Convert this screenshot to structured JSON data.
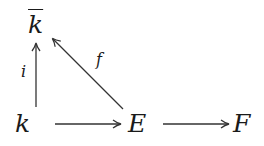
{
  "diagram": {
    "type": "commutative-diagram",
    "nodes": {
      "kbar": {
        "text": "k",
        "decoration": "overline",
        "x": 35,
        "y": 23
      },
      "k": {
        "text": "k",
        "x": 22,
        "y": 123
      },
      "E": {
        "text": "E",
        "x": 139,
        "y": 123
      },
      "F": {
        "text": "F",
        "x": 243,
        "y": 123
      }
    },
    "arrows": [
      {
        "from": "k",
        "to": "kbar",
        "label": "i"
      },
      {
        "from": "E",
        "to": "kbar",
        "label": "f"
      },
      {
        "from": "k",
        "to": "E",
        "label": ""
      },
      {
        "from": "E",
        "to": "F",
        "label": ""
      }
    ],
    "labels": {
      "i": "i",
      "f": "f"
    },
    "stroke_color": "#333333"
  }
}
